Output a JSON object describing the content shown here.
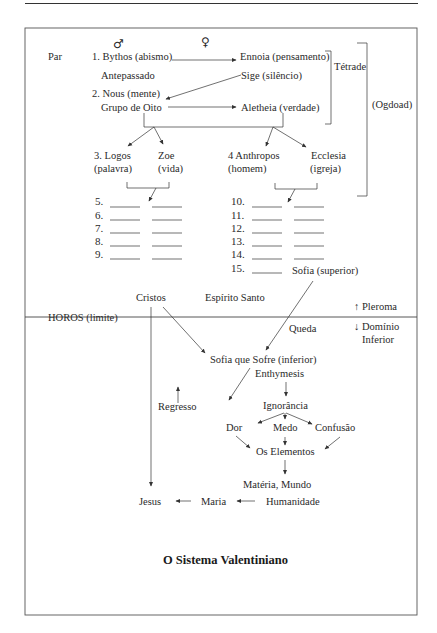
{
  "header": {
    "male_symbol": "♂",
    "female_symbol": "♀"
  },
  "pleroma": {
    "pair_label": "Par",
    "row1": {
      "male": "1. Bythos (abismo)",
      "female": "Ennoia (pensamento)"
    },
    "row1_sub": {
      "male": "Antepassado",
      "female": "Sige (silêncio)"
    },
    "row2": {
      "male": "2. Nous (mente)",
      "female": "Aletheia (verdade)"
    },
    "row2_sub": {
      "male": "Grupo de Oito"
    },
    "tetrade_label": "Tétrade",
    "ogdoad_label": "(Ogdoad)",
    "row3": {
      "logos": "3. Logos",
      "logos_sub": "(palavra)",
      "zoe": "Zoe",
      "zoe_sub": "(vida)",
      "anthropos": "4 Anthropos",
      "anthropos_sub": "(homem)",
      "ecclesia": "Ecclesia",
      "ecclesia_sub": "(igreja)"
    },
    "left_numbers": [
      "5.",
      "6.",
      "7.",
      "8.",
      "9."
    ],
    "right_numbers": [
      "10.",
      "11.",
      "12.",
      "13.",
      "14.",
      "15."
    ],
    "sofia_superior": "Sofia (superior)"
  },
  "boundary": {
    "cristos": "Cristos",
    "espirito_santo": "Espírito Santo",
    "horos": "HOROS (limite)",
    "pleroma_label": "Pleroma",
    "pleroma_arrow": "↑",
    "lower_label_1": "Domínio",
    "lower_label_2": "Inferior",
    "lower_arrow": "↓",
    "queda": "Queda"
  },
  "lower": {
    "sofia_inferior": "Sofia que Sofre (inferior)",
    "enthymesis": "Enthymesis",
    "regresso": "Regresso",
    "ignorancia": "Ignorância",
    "dor": "Dor",
    "medo": "Medo",
    "confusao": "Confusão",
    "elementos": "Os Elementos",
    "materia": "Matéria, Mundo",
    "jesus": "Jesus",
    "maria": "Maria",
    "humanidade": "Humanidade"
  },
  "caption": "O Sistema Valentiniano"
}
